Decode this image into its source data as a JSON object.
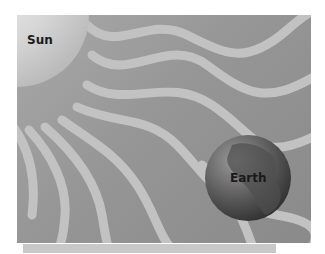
{
  "diagram": {
    "sun": {
      "label": "Sun"
    },
    "earth": {
      "label": "Earth"
    },
    "colors": {
      "background": "#969696",
      "rays": "#c4c4c4",
      "sun": "#d8d8d8",
      "earth_dark": "#3a3a3a"
    }
  }
}
